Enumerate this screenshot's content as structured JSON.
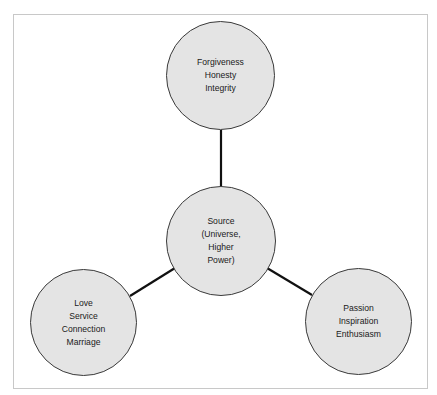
{
  "diagram": {
    "colors": {
      "node_fill": "#e4e4e4",
      "node_stroke": "#3a3a3a",
      "link_stroke": "#111111",
      "frame_border": "#c8c8c8",
      "text": "#1a1a1a"
    },
    "nodes": {
      "center": {
        "lines": [
          "Source",
          "(Universe,",
          "Higher",
          "Power)"
        ]
      },
      "top": {
        "lines": [
          "Forgiveness",
          "Honesty",
          "Integrity"
        ]
      },
      "left": {
        "lines": [
          "Love",
          "Service",
          "Connection",
          "Marriage"
        ]
      },
      "right": {
        "lines": [
          "Passion",
          "Inspiration",
          "Enthusiasm"
        ]
      }
    },
    "links": [
      {
        "from": "center",
        "to": "top"
      },
      {
        "from": "center",
        "to": "left"
      },
      {
        "from": "center",
        "to": "right"
      }
    ]
  }
}
